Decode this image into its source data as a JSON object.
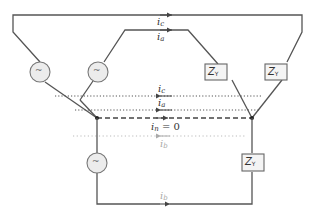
{
  "diagram": {
    "colors": {
      "wire": "#555555",
      "source_fill": "#ececec",
      "impedance_fill": "#f4f4f4",
      "faded_current": "#aaaaaa"
    },
    "sources": [
      {
        "id": "source-c",
        "symbol": "~"
      },
      {
        "id": "source-a",
        "symbol": "~"
      },
      {
        "id": "source-b",
        "symbol": "~"
      }
    ],
    "loads": [
      {
        "id": "load-a",
        "label": "Z",
        "subscript": "Y"
      },
      {
        "id": "load-c",
        "label": "Z",
        "subscript": "Y"
      },
      {
        "id": "load-b",
        "label": "Z",
        "subscript": "Y"
      }
    ],
    "currents": {
      "top_c": {
        "label": "i",
        "subscript": "c"
      },
      "top_a": {
        "label": "i",
        "subscript": "a"
      },
      "return_c": {
        "label": "i",
        "subscript": "c"
      },
      "return_a": {
        "label": "i",
        "subscript": "a"
      },
      "neutral": {
        "label": "i",
        "subscript": "n",
        "value_text": " = 0"
      },
      "return_b": {
        "label": "i",
        "subscript": "b"
      },
      "bottom_b": {
        "label": "i",
        "subscript": "b"
      }
    }
  }
}
